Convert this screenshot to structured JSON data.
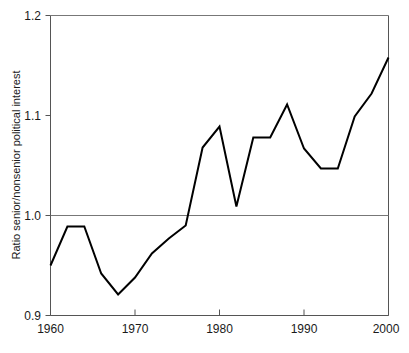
{
  "chart_data": {
    "type": "line",
    "title": "",
    "xlabel": "",
    "ylabel": "Ratio senior/nonsenior political interest",
    "xlim": [
      1960,
      2000
    ],
    "ylim": [
      0.9,
      1.2
    ],
    "xticks": [
      1960,
      1970,
      1980,
      1990,
      2000
    ],
    "xtick_labels": [
      "1960",
      "1970",
      "1980",
      "1990",
      "2000"
    ],
    "yticks": [
      0.9,
      1.0,
      1.1,
      1.2
    ],
    "ytick_labels": [
      "0.9",
      "1.0",
      "1.1",
      "1.2"
    ],
    "grid": false,
    "reference_lines": [
      1.0
    ],
    "legend": null,
    "legend_position": "none",
    "x": [
      1960,
      1962,
      1964,
      1966,
      1968,
      1970,
      1972,
      1974,
      1976,
      1978,
      1980,
      1982,
      1984,
      1986,
      1988,
      1990,
      1992,
      1994,
      1996,
      1998,
      2000
    ],
    "values": [
      0.95,
      0.989,
      0.989,
      0.942,
      0.921,
      0.938,
      0.962,
      0.977,
      0.99,
      1.068,
      1.089,
      1.009,
      1.078,
      1.078,
      1.111,
      1.067,
      1.047,
      1.047,
      1.099,
      1.122,
      1.158
    ],
    "series": [
      {
        "name": "Ratio senior/nonsenior political interest",
        "color": "#000000",
        "values": [
          0.95,
          0.989,
          0.989,
          0.942,
          0.921,
          0.938,
          0.962,
          0.977,
          0.99,
          1.068,
          1.089,
          1.009,
          1.078,
          1.078,
          1.111,
          1.067,
          1.047,
          1.047,
          1.099,
          1.122,
          1.158
        ]
      }
    ]
  },
  "axes": {
    "y_axis_title": "Ratio senior/nonsenior political interest",
    "y_tick_0": "0.9",
    "y_tick_1": "1.0",
    "y_tick_2": "1.1",
    "y_tick_3": "1.2",
    "x_tick_0": "1960",
    "x_tick_1": "1970",
    "x_tick_2": "1980",
    "x_tick_3": "1990",
    "x_tick_4": "2000"
  },
  "colors": {
    "series": "#000000",
    "axis": "#555555",
    "grid": "#777777",
    "background": "#ffffff",
    "text": "#1a1a1a"
  }
}
